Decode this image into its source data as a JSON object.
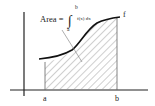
{
  "diagram": {
    "formula": {
      "lhs": "Area =",
      "integral_sign": "∫",
      "upper_limit": "b",
      "lower_limit": "a",
      "integrand": "f(x) dx"
    },
    "curve_label": "f",
    "axis_labels": {
      "a": "a",
      "b": "b"
    },
    "colors": {
      "ink": "#222222",
      "hatch": "#777777",
      "background": "#ffffff"
    }
  }
}
